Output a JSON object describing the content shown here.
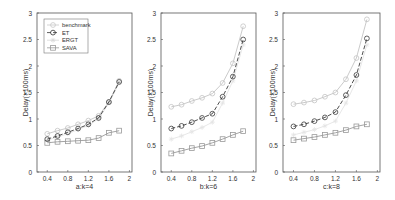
{
  "chart_data": [
    {
      "type": "line",
      "title": "",
      "xlabel": "a:k=4",
      "ylabel": "Delay(×100ms)",
      "xlim": [
        0.2,
        2.05
      ],
      "ylim": [
        0,
        3
      ],
      "xticks": [
        0.4,
        0.8,
        1.2,
        1.6,
        2
      ],
      "xtick_labels": [
        "0.4",
        "0.8",
        "1.2",
        "1.6",
        "2"
      ],
      "yticks": [
        0,
        0.5,
        1,
        1.5,
        2,
        2.5,
        3
      ],
      "ytick_labels": [
        "0",
        "0.5",
        "1",
        "1.5",
        "2",
        "2.5",
        "3"
      ],
      "grid": false,
      "legend_position": "upper left",
      "show_legend": true,
      "x": [
        0.4,
        0.6,
        0.8,
        1.0,
        1.2,
        1.4,
        1.6,
        1.8
      ],
      "series": [
        {
          "name": "benchmark",
          "values": [
            0.72,
            0.78,
            0.83,
            0.9,
            0.97,
            1.06,
            1.32,
            1.72
          ]
        },
        {
          "name": "ET",
          "values": [
            0.62,
            0.68,
            0.75,
            0.82,
            0.9,
            1.02,
            1.32,
            1.7
          ]
        },
        {
          "name": "ERGT",
          "values": [
            0.6,
            0.66,
            0.72,
            0.8,
            0.88,
            1.0,
            1.3,
            1.68
          ]
        },
        {
          "name": "SAVA",
          "values": [
            0.55,
            0.57,
            0.58,
            0.59,
            0.6,
            0.64,
            0.74,
            0.78
          ]
        }
      ]
    },
    {
      "type": "line",
      "title": "",
      "xlabel": "b:k=6",
      "ylabel": "Delay(×100ms)",
      "xlim": [
        0.2,
        2.05
      ],
      "ylim": [
        0,
        3
      ],
      "xticks": [
        0.4,
        0.8,
        1.2,
        1.6,
        2
      ],
      "xtick_labels": [
        "0.4",
        "0.8",
        "1.2",
        "1.6",
        "2"
      ],
      "yticks": [
        0,
        0.5,
        1,
        1.5,
        2,
        2.5,
        3
      ],
      "ytick_labels": [
        "0",
        "0.5",
        "1",
        "1.5",
        "2",
        "2.5",
        "3"
      ],
      "grid": false,
      "show_legend": false,
      "x": [
        0.4,
        0.6,
        0.8,
        1.0,
        1.2,
        1.4,
        1.6,
        1.8
      ],
      "series": [
        {
          "name": "benchmark",
          "values": [
            1.23,
            1.27,
            1.34,
            1.4,
            1.48,
            1.68,
            2.05,
            2.75
          ]
        },
        {
          "name": "ET",
          "values": [
            0.82,
            0.87,
            0.94,
            1.02,
            1.1,
            1.42,
            1.8,
            2.5
          ]
        },
        {
          "name": "ERGT",
          "values": [
            0.62,
            0.68,
            0.76,
            0.84,
            0.94,
            1.3,
            1.72,
            2.4
          ]
        },
        {
          "name": "SAVA",
          "values": [
            0.35,
            0.4,
            0.45,
            0.49,
            0.55,
            0.62,
            0.7,
            0.77
          ]
        }
      ]
    },
    {
      "type": "line",
      "title": "",
      "xlabel": "c:k=8",
      "ylabel": "Delay(×100ms)",
      "xlim": [
        0.2,
        2.05
      ],
      "ylim": [
        0,
        3
      ],
      "xticks": [
        0.4,
        0.8,
        1.2,
        1.6,
        2
      ],
      "xtick_labels": [
        "0.4",
        "0.8",
        "1.2",
        "1.6",
        "2"
      ],
      "yticks": [
        0,
        0.5,
        1,
        1.5,
        2,
        2.5,
        3
      ],
      "ytick_labels": [
        "0",
        "0.5",
        "1",
        "1.5",
        "2",
        "2.5",
        "3"
      ],
      "grid": false,
      "show_legend": false,
      "x": [
        0.4,
        0.6,
        0.8,
        1.0,
        1.2,
        1.4,
        1.6,
        1.8
      ],
      "series": [
        {
          "name": "benchmark",
          "values": [
            1.28,
            1.31,
            1.35,
            1.42,
            1.5,
            1.75,
            2.15,
            2.88
          ]
        },
        {
          "name": "ET",
          "values": [
            0.86,
            0.9,
            0.96,
            1.03,
            1.13,
            1.45,
            1.83,
            2.52
          ]
        },
        {
          "name": "ERGT",
          "values": [
            0.7,
            0.75,
            0.8,
            0.87,
            0.96,
            1.3,
            1.72,
            2.4
          ]
        },
        {
          "name": "SAVA",
          "values": [
            0.6,
            0.63,
            0.66,
            0.7,
            0.74,
            0.79,
            0.86,
            0.9
          ]
        }
      ]
    }
  ],
  "legend": {
    "items": [
      {
        "label": "benchmark",
        "color": "#c8c8c8",
        "dash": "",
        "marker": "diamond"
      },
      {
        "label": "ET",
        "color": "#333333",
        "dash": "4,2",
        "marker": "circle"
      },
      {
        "label": "ERGT",
        "color": "#e6e6e6",
        "dash": "",
        "marker": "star"
      },
      {
        "label": "SAVA",
        "color": "#999999",
        "dash": "",
        "marker": "square"
      }
    ]
  },
  "series_styles": {
    "benchmark": {
      "color": "#c4c4c4",
      "dash": "",
      "width": 0.9,
      "marker": "diamond"
    },
    "ET": {
      "color": "#3a3a3a",
      "dash": "4,2",
      "width": 0.9,
      "marker": "circle"
    },
    "ERGT": {
      "color": "#e4e4e4",
      "dash": "",
      "width": 0.9,
      "marker": "star"
    },
    "SAVA": {
      "color": "#9a9a9a",
      "dash": "",
      "width": 0.9,
      "marker": "square"
    }
  },
  "panels": [
    {
      "left": 37,
      "right": 132,
      "top": 13,
      "bottom": 172,
      "ylabel_x": 12,
      "label_y": 189
    },
    {
      "left": 161,
      "right": 256,
      "top": 13,
      "bottom": 172,
      "ylabel_x": 137,
      "label_y": 189
    },
    {
      "left": 283,
      "right": 380,
      "top": 13,
      "bottom": 172,
      "ylabel_x": 259,
      "label_y": 189
    }
  ]
}
